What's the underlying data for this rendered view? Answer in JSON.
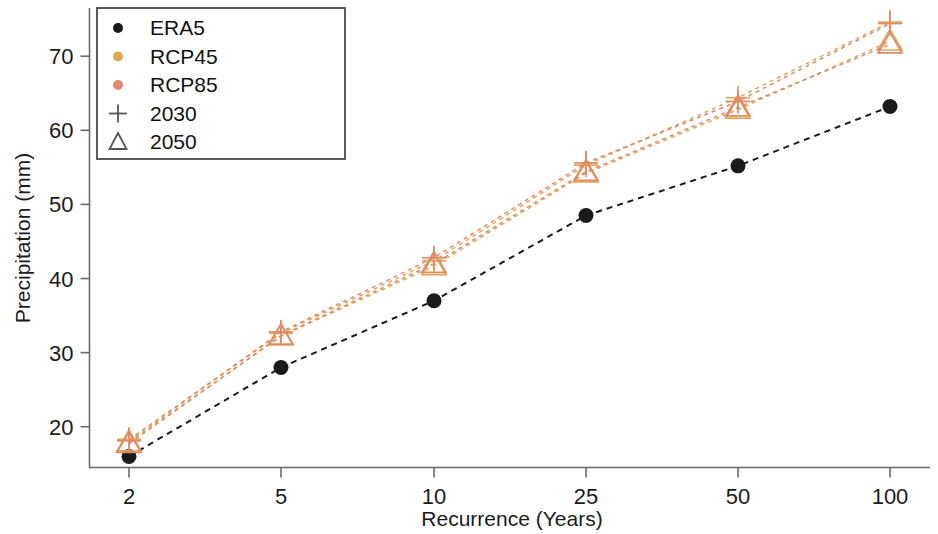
{
  "chart_data": {
    "type": "line",
    "title": "",
    "subtitle": "",
    "xlabel": "Recurrence (Years)",
    "ylabel": "Precipitation (mm)",
    "x": [
      2,
      5,
      10,
      25,
      50,
      100
    ],
    "xtick_labels": [
      "2",
      "5",
      "10",
      "25",
      "50",
      "100"
    ],
    "ytick_labels": [
      "20",
      "30",
      "40",
      "50",
      "60",
      "70"
    ],
    "yticks": [
      20,
      30,
      40,
      50,
      60,
      70
    ],
    "ylim": [
      14.5,
      76.5
    ],
    "grid": false,
    "legend_position": "top-left",
    "legend_entries": [
      {
        "label": "ERA5",
        "marker": "circle",
        "color": "#1a1a1a"
      },
      {
        "label": "RCP45",
        "marker": "circle",
        "color": "#e0a852"
      },
      {
        "label": "RCP85",
        "marker": "circle",
        "color": "#e08a6a"
      },
      {
        "label": "2030",
        "marker": "plus",
        "color": "#555555"
      },
      {
        "label": "2050",
        "marker": "triangle",
        "color": "#555555"
      }
    ],
    "series": [
      {
        "name": "ERA5",
        "scenario": "ERA5",
        "period": "",
        "marker": "circle",
        "color": "#1a1a1a",
        "values": [
          16.0,
          28.0,
          37.0,
          48.5,
          55.2,
          63.2
        ]
      },
      {
        "name": "RCP45 2030",
        "scenario": "RCP45",
        "period": "2030",
        "marker": "plus",
        "color": "#e0a852",
        "values": [
          18.3,
          32.6,
          42.4,
          55.3,
          64.4,
          74.6
        ]
      },
      {
        "name": "RCP45 2050",
        "scenario": "RCP45",
        "period": "2050",
        "marker": "triangle",
        "color": "#e0a852",
        "values": [
          17.9,
          32.2,
          41.7,
          54.2,
          62.8,
          72.0
        ]
      },
      {
        "name": "RCP85 2030",
        "scenario": "RCP85",
        "period": "2030",
        "marker": "plus",
        "color": "#e08a6a",
        "values": [
          18.1,
          32.8,
          42.8,
          55.6,
          63.9,
          74.4
        ]
      },
      {
        "name": "RCP85 2050",
        "scenario": "RCP85",
        "period": "2050",
        "marker": "triangle",
        "color": "#e08a6a",
        "values": [
          17.7,
          32.3,
          42.0,
          54.4,
          63.1,
          71.6
        ]
      }
    ]
  },
  "colors": {
    "era5": "#1a1a1a",
    "rcp45": "#e0a852",
    "rcp85": "#e08a6a",
    "axis": "#6b6b6b",
    "text": "#1b1b1b",
    "background": "#ffffff"
  }
}
